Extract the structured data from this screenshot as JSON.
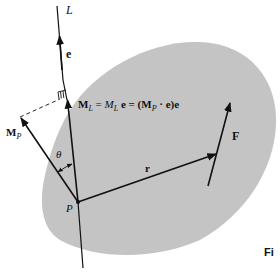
{
  "diagram": {
    "type": "vector moment about an axis",
    "colors": {
      "body_fill": "#c4c4c4",
      "ink": "#111111"
    },
    "labels": {
      "axis": "L",
      "unit_vector": "e",
      "equation": {
        "ml_bold": "M",
        "ml_sub": "L",
        "eq1": " = ",
        "ml_scalar": "M",
        "ml_scalar_sub": "L",
        "e1": " e = (M",
        "mp_sub": "P",
        "tail": " · e)e"
      },
      "moment_p": "M",
      "moment_p_sub": "P",
      "angle": "θ",
      "position_vector": "r",
      "force": "F",
      "point": "P",
      "figure_caption": "Fi"
    }
  }
}
